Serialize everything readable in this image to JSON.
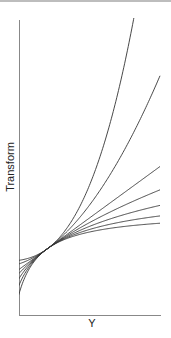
{
  "chart_data": {
    "type": "line",
    "title": "",
    "xlabel": "Y",
    "ylabel": "Transform",
    "grid": false,
    "legend": null,
    "series": [
      {
        "name": "lambda=3",
        "lambda": 3
      },
      {
        "name": "lambda=2",
        "lambda": 2
      },
      {
        "name": "lambda=1",
        "lambda": 1
      },
      {
        "name": "lambda=0.5",
        "lambda": 0.5
      },
      {
        "name": "lambda=0",
        "lambda": 0
      },
      {
        "name": "lambda=-0.5",
        "lambda": -0.5
      },
      {
        "name": "lambda=-1",
        "lambda": -1
      }
    ],
    "x_range": [
      0.45,
      3.2
    ],
    "ticks": "none"
  },
  "colors": {
    "axis": "#888888",
    "curve": "#333333",
    "text": "#222222"
  }
}
